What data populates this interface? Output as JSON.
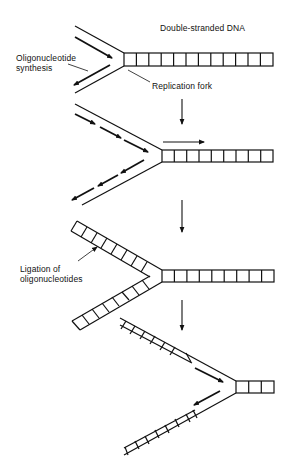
{
  "diagram": {
    "type": "dna-replication-fork-steps",
    "colors": {
      "stroke": "#111111",
      "background": "#ffffff"
    },
    "labels": {
      "double_stranded_dna": "Double-stranded DNA",
      "oligonucleotide_synthesis_line1": "Oligonucleotide",
      "oligonucleotide_synthesis_line2": "synthesis",
      "replication_fork": "Replication fork",
      "ligation_line1": "Ligation of",
      "ligation_line2": "oligonucleotides"
    },
    "steps": [
      {
        "index": 1,
        "duplex_boxes": 12,
        "description": "Replication fork with oligonucleotide synthesis on both strands"
      },
      {
        "index": 2,
        "duplex_boxes": 9,
        "description": "Fork advances; multiple oligonucleotide fragments synthesized"
      },
      {
        "index": 3,
        "duplex_boxes": 9,
        "description": "Oligonucleotides ligated onto both separated strands"
      },
      {
        "index": 4,
        "duplex_boxes": 3,
        "description": "Fork continues; new synthesis near fork"
      }
    ]
  }
}
